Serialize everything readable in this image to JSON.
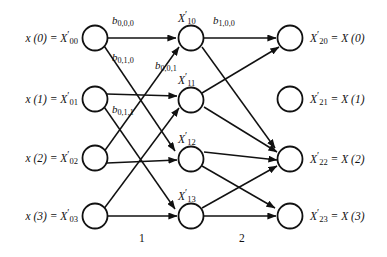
{
  "diagram": {
    "type": "butterfly-signal-flow-graph",
    "ink_color": "#111111",
    "background_color": "#ffffff"
  },
  "inputs": [
    {
      "id": "in0",
      "label_plain": "x (0) = X'00",
      "x_text": "x",
      "index_text": "(0)",
      "sym": "X",
      "sub": "00"
    },
    {
      "id": "in1",
      "label_plain": "x (1) = X'01",
      "x_text": "x",
      "index_text": "(1)",
      "sym": "X",
      "sub": "01"
    },
    {
      "id": "in2",
      "label_plain": "x (2) = X'02",
      "x_text": "x",
      "index_text": "(2)",
      "sym": "X",
      "sub": "02"
    },
    {
      "id": "in3",
      "label_plain": "x (3) = X'03",
      "x_text": "x",
      "index_text": "(3)",
      "sym": "X",
      "sub": "03"
    }
  ],
  "middle_nodes": [
    {
      "id": "mid0",
      "label_plain": "X'10",
      "sym": "X",
      "sub": "10"
    },
    {
      "id": "mid1",
      "label_plain": "X'11",
      "sym": "X",
      "sub": "11"
    },
    {
      "id": "mid2",
      "label_plain": "X'12",
      "sym": "X",
      "sub": "12"
    },
    {
      "id": "mid3",
      "label_plain": "X'13",
      "sym": "X",
      "sub": "13"
    }
  ],
  "outputs": [
    {
      "id": "out0",
      "label_plain": "X'20 = X (0)",
      "sym": "X",
      "sub": "20",
      "result_sym": "X",
      "result_index": "(0)"
    },
    {
      "id": "out1",
      "label_plain": "X'21 = X (1)",
      "sym": "X",
      "sub": "21",
      "result_sym": "X",
      "result_index": "(1)"
    },
    {
      "id": "out2",
      "label_plain": "X'22 = X (2)",
      "sym": "X",
      "sub": "22",
      "result_sym": "X",
      "result_index": "(2)"
    },
    {
      "id": "out3",
      "label_plain": "X'23 = X (3)",
      "sym": "X",
      "sub": "23",
      "result_sym": "X",
      "result_index": "(3)"
    }
  ],
  "coefficients": [
    {
      "id": "b000",
      "label_plain": "b0,0,0",
      "sym": "b",
      "sub": "0,0,0"
    },
    {
      "id": "b010",
      "label_plain": "b0,1,0",
      "sym": "b",
      "sub": "0,1,0"
    },
    {
      "id": "b001",
      "label_plain": "b0,0,1",
      "sym": "b",
      "sub": "0,0,1"
    },
    {
      "id": "b011",
      "label_plain": "b0,1,1",
      "sym": "b",
      "sub": "0,1,1"
    },
    {
      "id": "b100",
      "label_plain": "b1,0,0",
      "sym": "b",
      "sub": "1,0,0"
    }
  ],
  "stages": [
    {
      "id": "stage1",
      "label": "1"
    },
    {
      "id": "stage2",
      "label": "2"
    }
  ],
  "edges_stage1": [
    {
      "from": 0,
      "to": 0
    },
    {
      "from": 0,
      "to": 2
    },
    {
      "from": 1,
      "to": 1
    },
    {
      "from": 1,
      "to": 3
    },
    {
      "from": 2,
      "to": 0
    },
    {
      "from": 2,
      "to": 2
    },
    {
      "from": 3,
      "to": 1
    },
    {
      "from": 3,
      "to": 3
    }
  ],
  "edges_stage2": [
    {
      "from": 0,
      "to": 0
    },
    {
      "from": 0,
      "to": 1
    },
    {
      "from": 1,
      "to": 0
    },
    {
      "from": 1,
      "to": 1
    },
    {
      "from": 2,
      "to": 2
    },
    {
      "from": 2,
      "to": 3
    },
    {
      "from": 3,
      "to": 2
    },
    {
      "from": 3,
      "to": 3
    }
  ]
}
